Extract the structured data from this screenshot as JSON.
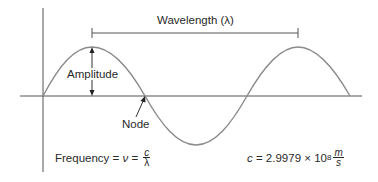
{
  "diagram": {
    "colors": {
      "wave": "#8a8a8a",
      "axes": "#555555",
      "text": "#2a2a2a"
    },
    "labels": {
      "wavelength": "Wavelength (λ)",
      "amplitude": "Amplitude",
      "node": "Node"
    },
    "frequency_formula": {
      "prefix": "Frequency = ",
      "symbol": "ν",
      "equals": " = ",
      "numerator": "c",
      "denominator": "λ"
    },
    "speed_of_light": {
      "symbol": "c",
      "equals": " = 2.9979 × 10",
      "exponent": "8",
      "unit_numerator": "m",
      "unit_denominator": "s"
    }
  }
}
